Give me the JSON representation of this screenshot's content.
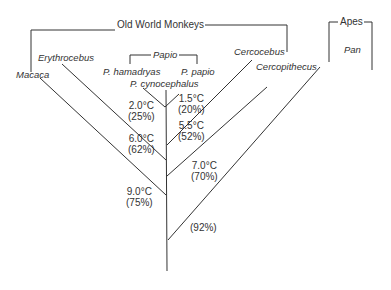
{
  "groups": {
    "old_world_monkeys": "Old World Monkeys",
    "apes": "Apes",
    "papio": "Papio"
  },
  "taxa": {
    "macaca": "Macaca",
    "erythrocebus": "Erythrocebus",
    "p_hamadryas": "P. hamadryas",
    "p_papio": "P. papio",
    "p_cynocephalus": "P. cynocephalus",
    "cercocebus": "Cercocebus",
    "cercopithecus": "Cercopithecus",
    "pan": "Pan"
  },
  "nodes": [
    {
      "temp": "1.5°C",
      "pct": "(20%)"
    },
    {
      "temp": "2.0°C",
      "pct": "(25%)"
    },
    {
      "temp": "5.5°C",
      "pct": "(52%)"
    },
    {
      "temp": "6.0°C",
      "pct": "(62%)"
    },
    {
      "temp": "7.0°C",
      "pct": "(70%)"
    },
    {
      "temp": "9.0°C",
      "pct": "(75%)"
    },
    {
      "temp": "",
      "pct": "(92%)"
    }
  ]
}
